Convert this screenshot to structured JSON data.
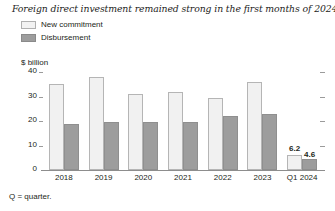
{
  "chart_data": {
    "type": "bar",
    "title": "Foreign direct investment remained strong in the first months of 2024.",
    "xlabel": "",
    "ylabel": "$ billion",
    "ylim": [
      0,
      40
    ],
    "yticks": [
      "40",
      "30",
      "20",
      "10",
      "0"
    ],
    "grid": false,
    "legend_position": "top-left",
    "categories": [
      "2018",
      "2019",
      "2020",
      "2021",
      "2022",
      "2023",
      "Q1 2024"
    ],
    "series": [
      {
        "name": "New commitment",
        "color": "#f1f1f1",
        "values": [
          35.0,
          38.0,
          31.0,
          32.0,
          29.5,
          36.0,
          6.2
        ],
        "labels": [
          "",
          "",
          "",
          "",
          "",
          "",
          "6.2"
        ]
      },
      {
        "name": "Disbursement",
        "color": "#9d9d9d",
        "values": [
          18.7,
          19.8,
          19.5,
          19.5,
          22.0,
          23.0,
          4.6
        ],
        "labels": [
          "",
          "",
          "",
          "",
          "",
          "",
          "4.6"
        ]
      }
    ],
    "footnote": "Q = quarter."
  }
}
